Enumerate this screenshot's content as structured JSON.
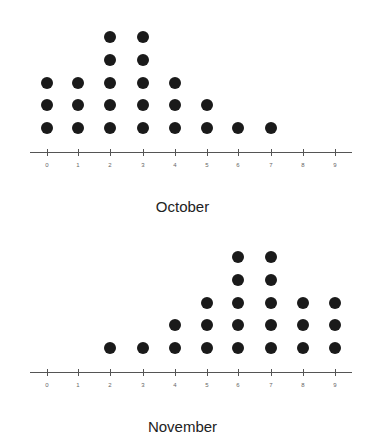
{
  "chart_data": [
    {
      "type": "dot",
      "title": "October",
      "xlabel": "October",
      "ylabel": "",
      "categories": [
        0,
        1,
        2,
        3,
        4,
        5,
        6,
        7,
        8,
        9
      ],
      "values": [
        3,
        3,
        5,
        5,
        3,
        2,
        1,
        1,
        0,
        0
      ],
      "tick_labels": [
        "0",
        "1",
        "2",
        "3",
        "4",
        "5",
        "6",
        "7",
        "8",
        "9"
      ],
      "grid": false
    },
    {
      "type": "dot",
      "title": "November",
      "xlabel": "November",
      "ylabel": "",
      "categories": [
        0,
        1,
        2,
        3,
        4,
        5,
        6,
        7,
        8,
        9
      ],
      "values": [
        0,
        0,
        1,
        1,
        2,
        3,
        5,
        5,
        3,
        3
      ],
      "tick_labels": [
        "0",
        "1",
        "2",
        "3",
        "4",
        "5",
        "6",
        "7",
        "8",
        "9"
      ],
      "grid": false
    }
  ],
  "plots": [
    {
      "title": "October",
      "axis_y": 152,
      "title_y": 198
    },
    {
      "title": "November",
      "axis_y": 372,
      "title_y": 418
    }
  ],
  "layout": {
    "tick_x": [
      47,
      78,
      110,
      143,
      175,
      207,
      238,
      271,
      303,
      335
    ],
    "row_spacing": 22.7,
    "first_row_offset": 24,
    "axis_left": 30,
    "axis_right": 352
  },
  "colors": {
    "dot": "#1a1a1a",
    "axis": "#555555"
  }
}
